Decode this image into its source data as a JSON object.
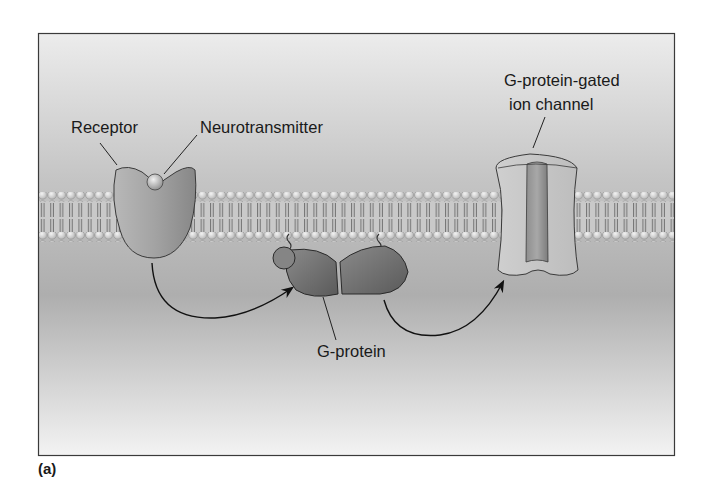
{
  "figure": {
    "panel_label": "(a)",
    "labels": {
      "receptor": "Receptor",
      "neurotransmitter": "Neurotransmitter",
      "channel_line1": "G-protein-gated",
      "channel_line2": "ion channel",
      "g_protein": "G-protein"
    },
    "colors": {
      "frame_border": "#3a3a3a",
      "background_top": "#e9e9e9",
      "background_mid": "#b9b9b9",
      "background_bottom": "#f2f2f2",
      "membrane_head": "#d8d8d8",
      "protein_fill": "#9a9a9a",
      "gprotein_fill": "#6f6f6f",
      "arrow": "#111111"
    }
  }
}
